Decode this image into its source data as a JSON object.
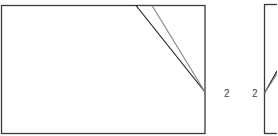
{
  "diagram": {
    "panels": [
      {
        "id": "left-panel",
        "rect": {
          "x": 1.5,
          "y": 5.5,
          "w": 203.5,
          "h": 128
        },
        "stroke": "#3a3a3a",
        "fold_lines": [
          {
            "x1": 136,
            "y1": 5.5,
            "x2": 205,
            "y2": 92,
            "stroke": "#222222"
          },
          {
            "x1": 152,
            "y1": 5.5,
            "x2": 205,
            "y2": 92,
            "stroke": "#8a8a8a"
          }
        ],
        "point_label": "2"
      },
      {
        "id": "right-panel",
        "rect": {
          "x": 264.5,
          "y": 4.5,
          "w": 20,
          "h": 129
        },
        "stroke": "#3a3a3a",
        "fold_lines": [
          {
            "x1": 264.5,
            "y1": 93,
            "x2": 277,
            "y2": 71,
            "stroke": "#222222"
          },
          {
            "x1": 264.5,
            "y1": 93,
            "x2": 277,
            "y2": 74,
            "stroke": "#8a8a8a"
          }
        ],
        "point_label": "2"
      }
    ]
  }
}
